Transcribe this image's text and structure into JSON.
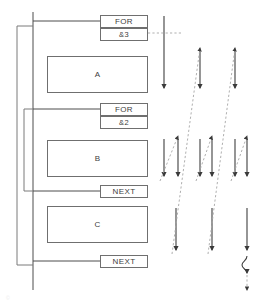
{
  "diagram": {
    "type": "nested-loop-flowchart",
    "colors": {
      "box_border": "#6f6f6f",
      "line": "#4d4d4d",
      "dashed_line": "#9a9a9a",
      "text": "#404040",
      "background": "#ffffff"
    },
    "blocks": [
      {
        "id": "for-outer",
        "label": "FOR",
        "x": 100,
        "y": 15,
        "w": 48,
        "h": 13
      },
      {
        "id": "for-outer-count",
        "label": "&3",
        "x": 100,
        "y": 28,
        "w": 48,
        "h": 13
      },
      {
        "id": "body-a",
        "label": "A",
        "x": 47,
        "y": 56,
        "w": 101,
        "h": 37
      },
      {
        "id": "for-inner",
        "label": "FOR",
        "x": 100,
        "y": 103,
        "w": 48,
        "h": 13
      },
      {
        "id": "for-inner-count",
        "label": "&2",
        "x": 100,
        "y": 116,
        "w": 48,
        "h": 13
      },
      {
        "id": "body-b",
        "label": "B",
        "x": 47,
        "y": 140,
        "w": 101,
        "h": 37
      },
      {
        "id": "next-inner",
        "label": "NEXT",
        "x": 100,
        "y": 185,
        "w": 48,
        "h": 13
      },
      {
        "id": "body-c",
        "label": "C",
        "x": 47,
        "y": 206,
        "w": 101,
        "h": 37
      },
      {
        "id": "next-outer",
        "label": "NEXT",
        "x": 100,
        "y": 255,
        "w": 48,
        "h": 13
      }
    ],
    "spine": {
      "x": 33,
      "y_top": 12,
      "y_bottom": 290
    },
    "brackets": [
      {
        "id": "outer-loop-bracket",
        "x": 17,
        "y_top": 26,
        "y_bottom": 265,
        "connect_x": 33
      },
      {
        "id": "inner-loop-bracket",
        "x": 24,
        "y_top": 109,
        "y_bottom": 191,
        "connect_x": 33
      }
    ],
    "timeline": {
      "entry_dashed": {
        "from_x": 148,
        "to_x": 181,
        "y": 33
      },
      "solid_arrows": [
        {
          "id": "t1",
          "x": 164,
          "y1": 16,
          "y2": 88
        },
        {
          "id": "t2",
          "x": 200,
          "y1": 52,
          "y2": 88
        },
        {
          "id": "t3",
          "x": 235,
          "y1": 52,
          "y2": 88
        },
        {
          "id": "t4",
          "x": 164,
          "y1": 139,
          "y2": 176
        },
        {
          "id": "t5",
          "x": 178,
          "y1": 139,
          "y2": 176
        },
        {
          "id": "t6",
          "x": 200,
          "y1": 139,
          "y2": 176
        },
        {
          "id": "t7",
          "x": 212,
          "y1": 139,
          "y2": 176
        },
        {
          "id": "t8",
          "x": 235,
          "y1": 139,
          "y2": 176
        },
        {
          "id": "t9",
          "x": 247,
          "y1": 139,
          "y2": 176
        },
        {
          "id": "t10",
          "x": 176,
          "y1": 208,
          "y2": 250
        },
        {
          "id": "t11",
          "x": 212,
          "y1": 208,
          "y2": 250
        },
        {
          "id": "t12",
          "x": 247,
          "y1": 208,
          "y2": 250
        }
      ],
      "dashed_arrows": [
        {
          "id": "d1",
          "x1": 160,
          "y1": 181,
          "x2": 178,
          "y2": 136
        },
        {
          "id": "d2",
          "x1": 196,
          "y1": 181,
          "x2": 212,
          "y2": 136
        },
        {
          "id": "d3",
          "x1": 231,
          "y1": 181,
          "x2": 247,
          "y2": 136
        },
        {
          "id": "d4",
          "x1": 172,
          "y1": 254,
          "x2": 200,
          "y2": 48
        },
        {
          "id": "d5",
          "x1": 208,
          "y1": 254,
          "x2": 235,
          "y2": 48
        }
      ],
      "break_symbol": {
        "x": 247,
        "y": 256,
        "to_y": 290
      }
    },
    "watermark": "©"
  }
}
